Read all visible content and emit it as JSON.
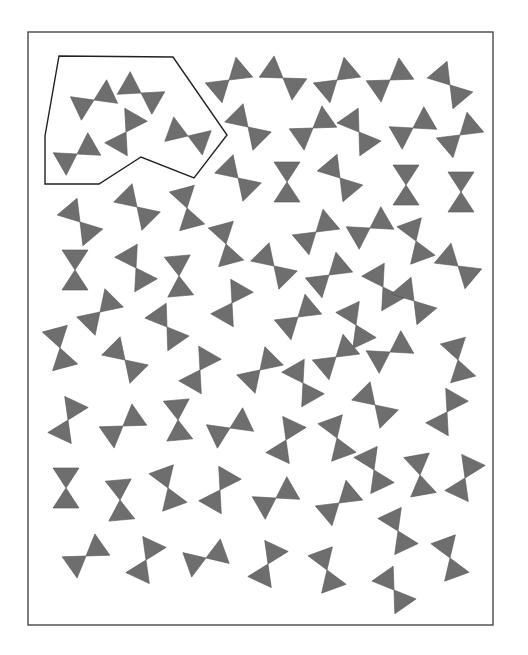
{
  "worksheet": {
    "frame": {
      "x": 28,
      "y": 32,
      "width": 465,
      "height": 593
    },
    "selection_polygon": [
      [
        59,
        56
      ],
      [
        173,
        57
      ],
      [
        227,
        135
      ],
      [
        194,
        178
      ],
      [
        141,
        157
      ],
      [
        99,
        184
      ],
      [
        45,
        184
      ],
      [
        45,
        136
      ]
    ],
    "bowtie_color": "#6e6e6e",
    "bowtie_size": {
      "half_length": 20,
      "half_width": 13
    },
    "bowties": [
      {
        "x": 94,
        "y": 100,
        "a": -25
      },
      {
        "x": 141,
        "y": 93,
        "a": 30
      },
      {
        "x": 126,
        "y": 132,
        "a": -60
      },
      {
        "x": 188,
        "y": 136,
        "a": 20
      },
      {
        "x": 77,
        "y": 154,
        "a": -30
      },
      {
        "x": 229,
        "y": 80,
        "a": -40
      },
      {
        "x": 283,
        "y": 78,
        "a": 35
      },
      {
        "x": 337,
        "y": 80,
        "a": -40
      },
      {
        "x": 390,
        "y": 80,
        "a": -35
      },
      {
        "x": 450,
        "y": 85,
        "a": 50
      },
      {
        "x": 248,
        "y": 127,
        "a": 45
      },
      {
        "x": 313,
        "y": 128,
        "a": -35
      },
      {
        "x": 359,
        "y": 132,
        "a": 55
      },
      {
        "x": 413,
        "y": 128,
        "a": -30
      },
      {
        "x": 460,
        "y": 135,
        "a": -40
      },
      {
        "x": 238,
        "y": 178,
        "a": 45
      },
      {
        "x": 287,
        "y": 182,
        "a": 90
      },
      {
        "x": 340,
        "y": 178,
        "a": 50
      },
      {
        "x": 406,
        "y": 185,
        "a": 90
      },
      {
        "x": 461,
        "y": 192,
        "a": 90
      },
      {
        "x": 80,
        "y": 222,
        "a": 50
      },
      {
        "x": 137,
        "y": 207,
        "a": 45
      },
      {
        "x": 187,
        "y": 208,
        "a": 75
      },
      {
        "x": 226,
        "y": 244,
        "a": 75
      },
      {
        "x": 316,
        "y": 232,
        "a": -40
      },
      {
        "x": 370,
        "y": 228,
        "a": -30
      },
      {
        "x": 416,
        "y": 241,
        "a": 70
      },
      {
        "x": 458,
        "y": 266,
        "a": 40
      },
      {
        "x": 75,
        "y": 270,
        "a": 90
      },
      {
        "x": 136,
        "y": 268,
        "a": 60
      },
      {
        "x": 179,
        "y": 276,
        "a": 85
      },
      {
        "x": 274,
        "y": 266,
        "a": 45
      },
      {
        "x": 329,
        "y": 275,
        "a": -40
      },
      {
        "x": 383,
        "y": 287,
        "a": 60
      },
      {
        "x": 100,
        "y": 312,
        "a": -45
      },
      {
        "x": 167,
        "y": 327,
        "a": 55
      },
      {
        "x": 232,
        "y": 303,
        "a": -60
      },
      {
        "x": 298,
        "y": 317,
        "a": -40
      },
      {
        "x": 356,
        "y": 325,
        "a": 65
      },
      {
        "x": 414,
        "y": 301,
        "a": 50
      },
      {
        "x": 60,
        "y": 348,
        "a": 75
      },
      {
        "x": 125,
        "y": 360,
        "a": 45
      },
      {
        "x": 200,
        "y": 370,
        "a": -60
      },
      {
        "x": 260,
        "y": 370,
        "a": -45
      },
      {
        "x": 336,
        "y": 357,
        "a": -40
      },
      {
        "x": 390,
        "y": 352,
        "a": -30
      },
      {
        "x": 458,
        "y": 360,
        "a": 75
      },
      {
        "x": 303,
        "y": 383,
        "a": 60
      },
      {
        "x": 375,
        "y": 405,
        "a": 45
      },
      {
        "x": 447,
        "y": 412,
        "a": -60
      },
      {
        "x": 68,
        "y": 420,
        "a": -65
      },
      {
        "x": 123,
        "y": 426,
        "a": -35
      },
      {
        "x": 178,
        "y": 420,
        "a": 85
      },
      {
        "x": 230,
        "y": 428,
        "a": -25
      },
      {
        "x": 286,
        "y": 440,
        "a": -65
      },
      {
        "x": 337,
        "y": 438,
        "a": 70
      },
      {
        "x": 374,
        "y": 470,
        "a": 65
      },
      {
        "x": 420,
        "y": 475,
        "a": 80
      },
      {
        "x": 465,
        "y": 478,
        "a": -65
      },
      {
        "x": 66,
        "y": 488,
        "a": 90
      },
      {
        "x": 120,
        "y": 500,
        "a": 85
      },
      {
        "x": 168,
        "y": 488,
        "a": 70
      },
      {
        "x": 220,
        "y": 490,
        "a": -60
      },
      {
        "x": 276,
        "y": 498,
        "a": -30
      },
      {
        "x": 339,
        "y": 503,
        "a": -40
      },
      {
        "x": 398,
        "y": 531,
        "a": 65
      },
      {
        "x": 450,
        "y": 558,
        "a": 70
      },
      {
        "x": 86,
        "y": 556,
        "a": -35
      },
      {
        "x": 146,
        "y": 560,
        "a": -65
      },
      {
        "x": 206,
        "y": 558,
        "a": -20
      },
      {
        "x": 268,
        "y": 564,
        "a": -65
      },
      {
        "x": 327,
        "y": 570,
        "a": 70
      },
      {
        "x": 394,
        "y": 590,
        "a": 55
      }
    ]
  }
}
